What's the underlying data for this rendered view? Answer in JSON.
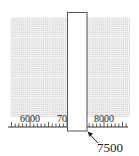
{
  "number_line": {
    "labels": [
      {
        "value": 6000,
        "text": "6000"
      },
      {
        "value": 7000,
        "text": "70"
      },
      {
        "value": 8000,
        "text": "8000"
      }
    ],
    "min_value": 5400,
    "max_value": 8600,
    "minor_step": 100,
    "major_step": 1000
  },
  "cover_box": {
    "from_value": 7000,
    "to_value": 7540
  },
  "pointer": {
    "label": "7500"
  },
  "colors": {
    "grid": "#c8c8c8",
    "line": "#333333",
    "box_border": "#555555"
  }
}
